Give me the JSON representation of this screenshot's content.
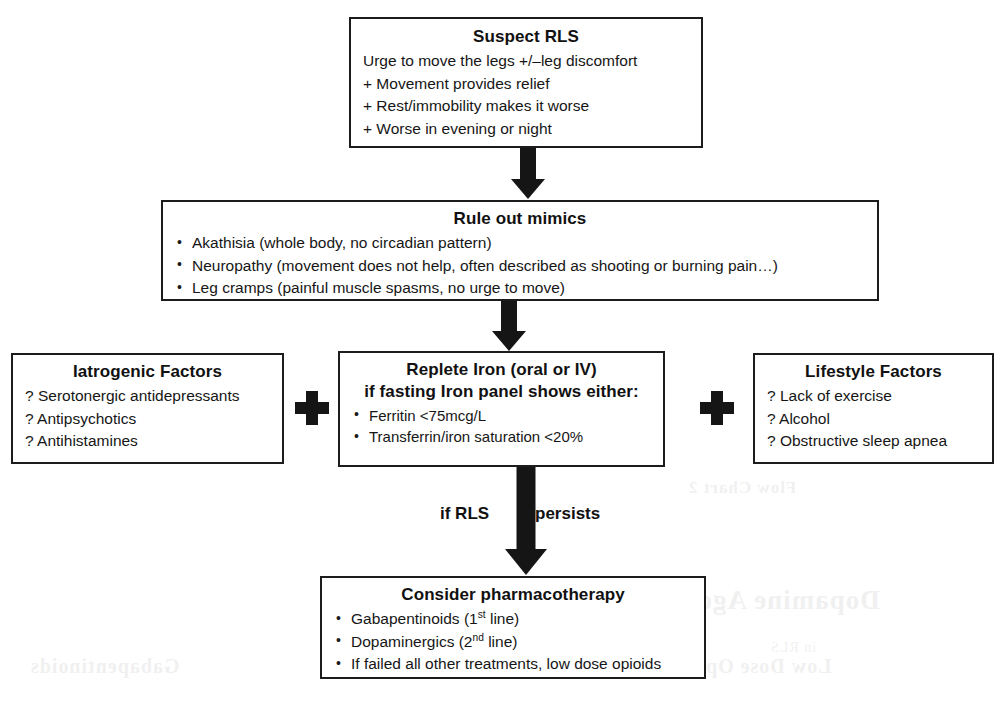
{
  "diagram": {
    "colors": {
      "ink": "#151515",
      "background": "#ffffff",
      "border": "#1c1c1c"
    },
    "nodes": {
      "suspect": {
        "title": "Suspect RLS",
        "lines": [
          "Urge to move the legs +/–leg discomfort",
          "+ Movement provides relief",
          "+ Rest/immobility makes it worse",
          "+ Worse in evening or night"
        ]
      },
      "mimics": {
        "title": "Rule out mimics",
        "lines": [
          "Akathisia (whole body, no circadian pattern)",
          "Neuropathy (movement does not help, often described as shooting or burning pain…)",
          "Leg cramps (painful muscle spasms, no urge to move)"
        ]
      },
      "iatrogenic": {
        "title": "Iatrogenic Factors",
        "lines": [
          "? Serotonergic antidepressants",
          "? Antipsychotics",
          "? Antihistamines"
        ]
      },
      "iron": {
        "title_line_1": "Replete Iron (oral or IV)",
        "title_line_2": "if fasting Iron panel shows either:",
        "lines": [
          "Ferritin <75mcg/L",
          "Transferrin/iron saturation <20%"
        ]
      },
      "lifestyle": {
        "title": "Lifestyle Factors",
        "lines": [
          "? Lack of exercise",
          "? Alcohol",
          "? Obstructive sleep apnea"
        ]
      },
      "pharma": {
        "title": "Consider pharmacotherapy",
        "bullets": [
          {
            "pre": "Gabapentinoids (1",
            "sup": "st",
            "post": " line)"
          },
          {
            "pre": "Dopaminergics (2",
            "sup": "nd",
            "post": " line)"
          },
          {
            "pre": "If failed all other treatments, low dose opioids",
            "sup": "",
            "post": ""
          }
        ]
      }
    },
    "connectors": {
      "plus_left": "+",
      "plus_right": "+",
      "persists_left": "if RLS",
      "persists_right": "persists"
    },
    "artifacts": {
      "bleed_1": "Flow Chart 2",
      "bleed_2": "Dopamine Agonists",
      "bleed_3": "Low Dose Opioids",
      "bleed_4": "Gabapentinoids",
      "bleed_5": "in RLS"
    }
  }
}
